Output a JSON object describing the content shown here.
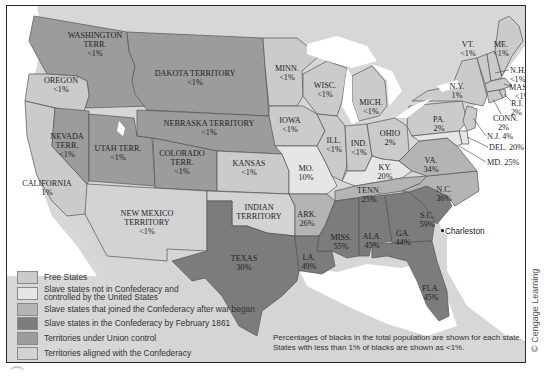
{
  "colors": {
    "free_states": "#cbcbcb",
    "slave_not_confederacy": "#e6e6e6",
    "joined_after_war": "#b4b4b4",
    "confederacy_by_feb_1861": "#7c7c7c",
    "territories_union": "#9c9c9c",
    "territories_confederacy": "#d3d3d3",
    "water": "#ffffff",
    "foreign_land": "#d7d7d7"
  },
  "legend": {
    "items": [
      {
        "key": "free_states",
        "label": "Free States"
      },
      {
        "key": "slave_not_confederacy",
        "label_line1": "Slave states not in Confederacy and",
        "label_line2": "controlled by the United States"
      },
      {
        "key": "joined_after_war",
        "label": "Slave states that joined the Confederacy after war began"
      },
      {
        "key": "confederacy_by_feb_1861",
        "label": "Slave states in the Confederacy by February 1861"
      },
      {
        "key": "territories_union",
        "label": "Territories under Union control"
      },
      {
        "key": "territories_confederacy",
        "label": "Territories aligned with the Confederacy"
      }
    ]
  },
  "note": {
    "line1": "Percentages of blacks in the total population are shown for each state.",
    "line2": "States with less than 1% of blacks are shown as <1%."
  },
  "city": {
    "name": "Charleston"
  },
  "credit": "© Cengage Learning",
  "regions": {
    "washington": {
      "name1": "WASHINGTON",
      "name2": "TERR.",
      "pct": "<1%",
      "category": "territories_union"
    },
    "oregon": {
      "name": "OREGON",
      "pct": "<1%",
      "category": "free_states"
    },
    "california": {
      "name": "CALIFORNIA",
      "pct": "1%",
      "category": "free_states"
    },
    "nevada": {
      "name1": "NEVADA",
      "name2": "TERR.",
      "pct": "<1%",
      "category": "territories_union"
    },
    "utah": {
      "name": "UTAH TERR.",
      "pct": "<1%",
      "category": "territories_union"
    },
    "colorado": {
      "name1": "COLORADO",
      "name2": "TERR.",
      "pct": "<1%",
      "category": "territories_union"
    },
    "dakota": {
      "name": "DAKOTA TERRITORY",
      "pct": "<1%",
      "category": "territories_union"
    },
    "nebraska": {
      "name": "NEBRASKA TERRITORY",
      "pct": "<1%",
      "category": "territories_union"
    },
    "kansas": {
      "name": "KANSAS",
      "pct": "<1%",
      "category": "free_states"
    },
    "new_mexico": {
      "name1": "NEW MEXICO",
      "name2": "TERRITORY",
      "pct": "<1%",
      "category": "territories_confederacy"
    },
    "indian": {
      "name1": "INDIAN",
      "name2": "TERRITORY",
      "category": "territories_confederacy"
    },
    "texas": {
      "name": "TEXAS",
      "pct": "30%",
      "category": "confederacy_by_feb_1861"
    },
    "minnesota": {
      "name": "MINN.",
      "pct": "<1%",
      "category": "free_states"
    },
    "iowa": {
      "name": "IOWA",
      "pct": "<1%",
      "category": "free_states"
    },
    "missouri": {
      "name": "MO.",
      "pct": "10%",
      "category": "slave_not_confederacy"
    },
    "arkansas": {
      "name": "ARK.",
      "pct": "26%",
      "category": "joined_after_war"
    },
    "louisiana": {
      "name": "LA.",
      "pct": "49%",
      "category": "confederacy_by_feb_1861"
    },
    "wisconsin": {
      "name": "WISC.",
      "pct": "<1%",
      "category": "free_states"
    },
    "illinois": {
      "name": "ILL.",
      "pct": "<1%",
      "category": "free_states"
    },
    "michigan": {
      "name": "MICH.",
      "pct": "<1%",
      "category": "free_states"
    },
    "indiana": {
      "name": "IND.",
      "pct": "<1%",
      "category": "free_states"
    },
    "ohio": {
      "name": "OHIO",
      "pct": "2%",
      "category": "free_states"
    },
    "kentucky": {
      "name": "KY.",
      "pct": "20%",
      "category": "slave_not_confederacy"
    },
    "tennessee": {
      "name": "TENN.",
      "pct": "25%",
      "category": "joined_after_war"
    },
    "mississippi": {
      "name": "MISS.",
      "pct": "55%",
      "category": "confederacy_by_feb_1861"
    },
    "alabama": {
      "name": "ALA.",
      "pct": "45%",
      "category": "confederacy_by_feb_1861"
    },
    "georgia": {
      "name": "GA.",
      "pct": "44%",
      "category": "confederacy_by_feb_1861"
    },
    "florida": {
      "name": "FLA.",
      "pct": "45%",
      "category": "confederacy_by_feb_1861"
    },
    "south_carolina": {
      "name": "S.C.",
      "pct": "59%",
      "category": "confederacy_by_feb_1861"
    },
    "north_carolina": {
      "name": "N.C.",
      "pct": "36%",
      "category": "joined_after_war"
    },
    "virginia": {
      "name": "VA.",
      "pct": "34%",
      "category": "joined_after_war"
    },
    "pennsylvania": {
      "name": "PA.",
      "pct": "2%",
      "category": "free_states"
    },
    "new_york": {
      "name": "N.Y.",
      "pct": "1%",
      "category": "free_states"
    },
    "vermont": {
      "name": "VT.",
      "pct": "<1%",
      "category": "free_states"
    },
    "maine": {
      "name": "ME.",
      "pct": "<1%",
      "category": "free_states"
    },
    "new_hampshire": {
      "name": "N.H.",
      "pct": "<1%",
      "category": "free_states"
    },
    "massachusetts": {
      "name": "MASS.",
      "pct": "<1%",
      "category": "free_states"
    },
    "rhode_island": {
      "name": "R.I.",
      "pct": "2%",
      "category": "free_states"
    },
    "connecticut": {
      "name": "CONN.",
      "pct": "2%",
      "category": "free_states"
    },
    "new_jersey": {
      "name": "N.J. 4%",
      "category": "free_states"
    },
    "delaware": {
      "name": "DEL. 20%",
      "category": "slave_not_confederacy"
    },
    "maryland": {
      "name": "MD. 25%",
      "category": "slave_not_confederacy"
    }
  }
}
